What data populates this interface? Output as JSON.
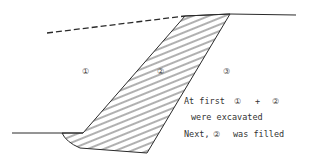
{
  "diagram": {
    "type": "excavation-fill cross-section",
    "regions": [
      {
        "id": "1",
        "label": "①",
        "desc": "excavated region left"
      },
      {
        "id": "2",
        "label": "②",
        "desc": "hatched fill region"
      },
      {
        "id": "3",
        "label": "③",
        "desc": "in-situ ground right"
      }
    ],
    "notes": {
      "line1_a": "At first",
      "line1_c1": "①",
      "line1_plus": "+",
      "line1_c2": "②",
      "line2": "were excavated",
      "line3_a": "Next,",
      "line3_c": "②",
      "line3_b": "was filled"
    },
    "colors": {
      "line": "#2a2a2a",
      "hatch": "#3a3a3a",
      "background": "#ffffff"
    }
  }
}
